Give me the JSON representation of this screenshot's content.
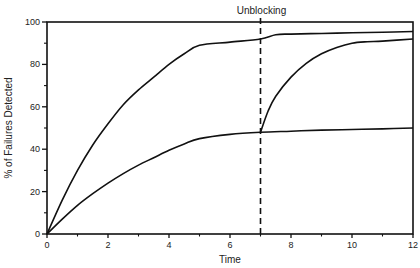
{
  "chart_data": {
    "type": "line",
    "title": "",
    "xlabel": "Time",
    "ylabel": "% of Failures Detected",
    "xlim": [
      0,
      12
    ],
    "ylim": [
      0,
      100
    ],
    "x_ticks": [
      0,
      2,
      4,
      6,
      8,
      10,
      12
    ],
    "y_ticks": [
      0,
      20,
      40,
      60,
      80,
      100
    ],
    "x_minor_step": 1,
    "y_minor_step": 10,
    "grid": false,
    "legend": null,
    "annotations": [
      {
        "text": "Unblocking",
        "x": 7,
        "type": "vertical-dashed-line"
      }
    ],
    "series": [
      {
        "name": "Upper curve",
        "x": [
          0,
          0.5,
          1,
          1.5,
          2,
          2.5,
          3,
          3.5,
          4,
          4.5,
          5,
          6,
          7,
          7.5,
          8,
          9,
          10,
          11,
          12
        ],
        "values": [
          0,
          16,
          30,
          42,
          52,
          61,
          68,
          74,
          80,
          85,
          89,
          90.5,
          92,
          94,
          94.3,
          94.6,
          94.9,
          95.2,
          95.5
        ]
      },
      {
        "name": "Lower curve",
        "x": [
          0,
          0.5,
          1,
          1.5,
          2,
          2.5,
          3,
          3.5,
          4,
          4.5,
          5,
          6,
          7,
          8,
          9,
          10,
          11,
          12
        ],
        "values": [
          0,
          7,
          13.5,
          19,
          24,
          28.5,
          32.5,
          36,
          39.5,
          42.5,
          45,
          47,
          48,
          48.5,
          49,
          49.3,
          49.6,
          50
        ]
      },
      {
        "name": "After unblocking",
        "x": [
          7,
          7.25,
          7.5,
          8,
          8.5,
          9,
          9.5,
          10,
          10.5,
          11,
          12
        ],
        "values": [
          48,
          58,
          65,
          74,
          80.5,
          85,
          88,
          90,
          90.7,
          91,
          92
        ]
      }
    ]
  },
  "plot": {
    "x_label": "Time",
    "y_label": "% of Failures Detected",
    "annotation": "Unblocking"
  }
}
